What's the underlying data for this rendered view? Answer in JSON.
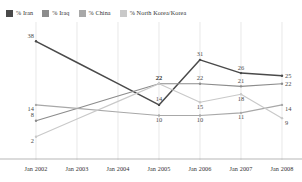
{
  "chart_data": {
    "type": "line",
    "title": "",
    "subtitle": "",
    "xlabel": "",
    "ylabel": "",
    "grid": "vertical",
    "legend_position": "top",
    "categories": [
      "Jan 2002",
      "Jan 2003",
      "Jan 2004",
      "Jan 2005",
      "Jan 2006",
      "Jan 2007",
      "Jan 2008"
    ],
    "ylim": [
      0,
      40
    ],
    "series": [
      {
        "name": "% Iran",
        "color": "#4a4a4a",
        "values": [
          38,
          null,
          null,
          14,
          31,
          26,
          25
        ],
        "labels": [
          "38",
          "",
          "",
          "14",
          "31",
          "26",
          "25"
        ]
      },
      {
        "name": "% Iraq",
        "color": "#8c8c8c",
        "values": [
          8,
          null,
          null,
          22,
          22,
          21,
          22
        ],
        "labels": [
          "8",
          "",
          "",
          "22",
          "22",
          "21",
          "22"
        ]
      },
      {
        "name": "% China",
        "color": "#a8a8a8",
        "values": [
          14,
          null,
          null,
          10,
          10,
          11,
          14
        ],
        "labels": [
          "14",
          "",
          "",
          "10",
          "10",
          "11",
          "14"
        ]
      },
      {
        "name": "% North Korea/Korea",
        "color": "#c9c9c9",
        "values": [
          2,
          null,
          null,
          22,
          15,
          18,
          9
        ],
        "labels": [
          "2",
          "",
          "",
          "22",
          "15",
          "18",
          "9"
        ]
      }
    ]
  },
  "legend": {
    "items": [
      {
        "label": "% Iran",
        "color": "#4a4a4a"
      },
      {
        "label": "% Iraq",
        "color": "#8c8c8c"
      },
      {
        "label": "% China",
        "color": "#a8a8a8"
      },
      {
        "label": "% North Korea/Korea",
        "color": "#c9c9c9"
      }
    ]
  }
}
